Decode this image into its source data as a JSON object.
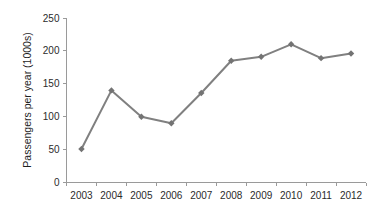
{
  "chart_data": {
    "type": "line",
    "title": "",
    "xlabel": "",
    "ylabel": "Passengers per year (1000s)",
    "categories": [
      "2003",
      "2004",
      "2005",
      "2006",
      "2007",
      "2008",
      "2009",
      "2010",
      "2011",
      "2012"
    ],
    "values": [
      51,
      140,
      100,
      90,
      136,
      185,
      191,
      210,
      189,
      196
    ],
    "series": [
      {
        "name": "Passengers",
        "values": [
          51,
          140,
          100,
          90,
          136,
          185,
          191,
          210,
          189,
          196
        ]
      }
    ],
    "ylim": [
      0,
      250
    ],
    "yticks": [
      0,
      50,
      100,
      150,
      200,
      250
    ],
    "ytick_labels": [
      "0",
      "50",
      "100",
      "150",
      "200",
      "250"
    ],
    "grid": false,
    "legend": false,
    "marker": "diamond",
    "line_color": "#808080",
    "marker_color": "#737373",
    "axis_color": "#9a9a9a",
    "text_color": "#2b2b2b",
    "background": "#ffffff"
  }
}
